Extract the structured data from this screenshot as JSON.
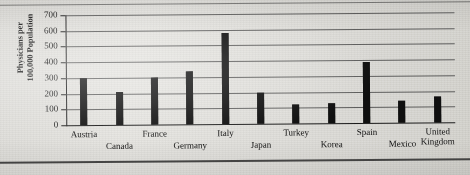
{
  "chart_data": {
    "type": "bar",
    "title": "",
    "xlabel": "",
    "ylabel": "Physicians per\n100,000 Population",
    "ylabel_line1": "Physicians per",
    "ylabel_line2": "100,000 Population",
    "ylim": [
      0,
      700
    ],
    "ytick_step": 100,
    "ytick_labels": [
      "700",
      "600",
      "500",
      "400",
      "300",
      "200",
      "100",
      "0"
    ],
    "ytick_values": [
      700,
      600,
      500,
      400,
      300,
      200,
      100,
      0
    ],
    "grid": true,
    "legend": "none",
    "bar_color": "#111111",
    "categories": [
      "Austria",
      "Canada",
      "France",
      "Germany",
      "Italy",
      "Japan",
      "Turkey",
      "Korea",
      "Spain",
      "Mexico",
      "United\nKingdom"
    ],
    "category_label_rows": [
      0,
      1,
      0,
      1,
      0,
      1,
      0,
      1,
      0,
      1,
      0
    ],
    "values": [
      300,
      210,
      300,
      340,
      580,
      200,
      120,
      130,
      390,
      140,
      165
    ]
  }
}
